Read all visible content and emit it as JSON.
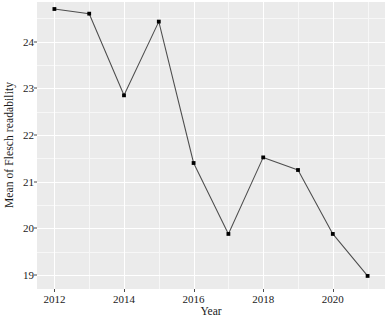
{
  "chart_data": {
    "type": "line",
    "title": "",
    "xlabel": "Year",
    "ylabel": "Mean of Flesch readability",
    "x": [
      2012,
      2013,
      2014,
      2015,
      2016,
      2017,
      2018,
      2019,
      2020,
      2021
    ],
    "values": [
      24.7,
      24.6,
      22.85,
      24.43,
      21.4,
      19.88,
      21.52,
      21.25,
      19.88,
      18.98
    ],
    "series": [
      {
        "name": "Mean of Flesch readability",
        "values": [
          24.7,
          24.6,
          22.85,
          24.43,
          21.4,
          19.88,
          21.52,
          21.25,
          19.88,
          18.98
        ]
      }
    ],
    "xlim": [
      2011.5,
      2021.5
    ],
    "ylim": [
      18.7,
      24.85
    ],
    "xticks": [
      2012,
      2014,
      2016,
      2018,
      2020
    ],
    "xtick_labels": [
      "2012",
      "2014",
      "2016",
      "2018",
      "2020"
    ],
    "yticks": [
      19,
      20,
      21,
      22,
      23,
      24
    ],
    "ytick_labels": [
      "19",
      "20",
      "21",
      "22",
      "23",
      "24"
    ],
    "y_minor_ticks": [
      19.5,
      20.5,
      21.5,
      22.5,
      23.5,
      24.5
    ],
    "x_minor_ticks": [
      2013,
      2015,
      2017,
      2019,
      2021
    ],
    "grid": true,
    "legend": false,
    "legend_position": "none",
    "line_color": "#4d4d4d",
    "marker_color": "#000000",
    "panel_background": "#ebebeb",
    "gridline_color": "#ffffff"
  },
  "axes": {
    "y_title": "Mean of Flesch readability",
    "x_title": "Year"
  },
  "caption": {
    "text": ""
  }
}
